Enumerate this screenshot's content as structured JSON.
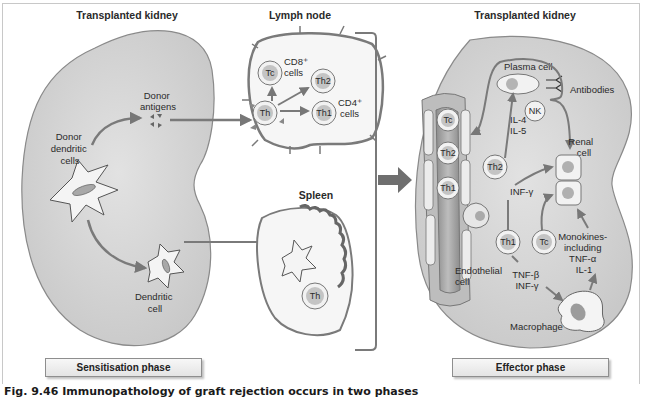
{
  "figure": {
    "caption": "Fig. 9.46    Immunopathology of graft rejection occurs in two phases",
    "colors": {
      "kidney_fill": "#d4d4d4",
      "kidney_stroke": "#8a8a8a",
      "arrow": "#7a7a7a",
      "cell_fill": "#f2f2f2",
      "nucleus": "#c0c0c0",
      "vessel": "#9a9a9a"
    }
  },
  "sensitisation": {
    "kidney_title": "Transplanted kidney",
    "donor_dendritic_label": [
      "Donor",
      "dendritic",
      "cells"
    ],
    "donor_antigens_label": [
      "Donor",
      "antigens"
    ],
    "dendritic_cell_label": [
      "Dendritic",
      "cell"
    ],
    "phase_label": "Sensitisation phase"
  },
  "lymph_node": {
    "title": "Lymph node",
    "cells": {
      "th": "Th",
      "tc": "Tc",
      "th2": "Th2",
      "th1": "Th1"
    },
    "cd8_label": [
      "CD8⁺",
      "cells"
    ],
    "cd4_label": [
      "CD4⁺",
      "cells"
    ]
  },
  "spleen": {
    "title": "Spleen",
    "cell": "Th"
  },
  "effector": {
    "kidney_title": "Transplanted kidney",
    "plasma_cell_label": "Plasma cell",
    "antibodies_label": "Antibodies",
    "nk_label": "NK",
    "il_labels": [
      "IL-4",
      "IL-5"
    ],
    "renal_cell_label": [
      "Renal",
      "cell"
    ],
    "vessel_cells": [
      "Tc",
      "Th2",
      "Th1"
    ],
    "th2": "Th2",
    "th1": "Th1",
    "tc": "Tc",
    "inf_gamma_label": "INF-γ",
    "tnf_label": [
      "TNF-β",
      "INF-γ"
    ],
    "monokines_label": [
      "Monokines-",
      "including",
      "TNF-α",
      "IL-1"
    ],
    "endothelial_label": [
      "Endothelial",
      "cell"
    ],
    "macrophage_label": "Macrophage",
    "phase_label": "Effector phase"
  }
}
